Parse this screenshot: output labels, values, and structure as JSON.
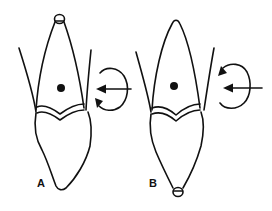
{
  "figure": {
    "panels": [
      {
        "label": "A",
        "fulcrum_marker": "root-apex",
        "rotation_direction": "counterclockwise",
        "force": "lingual-force-arrow"
      },
      {
        "label": "B",
        "fulcrum_marker": "crown-incisal-edge",
        "rotation_direction": "clockwise",
        "force": "lingual-force-arrow"
      }
    ],
    "icons": {
      "center_of_resistance": "filled-dot",
      "force": "arrow-left",
      "rotation": "circular-arrow",
      "fulcrum": "small-circle"
    },
    "colors": {
      "ink": "#111111",
      "background": "#ffffff"
    }
  }
}
